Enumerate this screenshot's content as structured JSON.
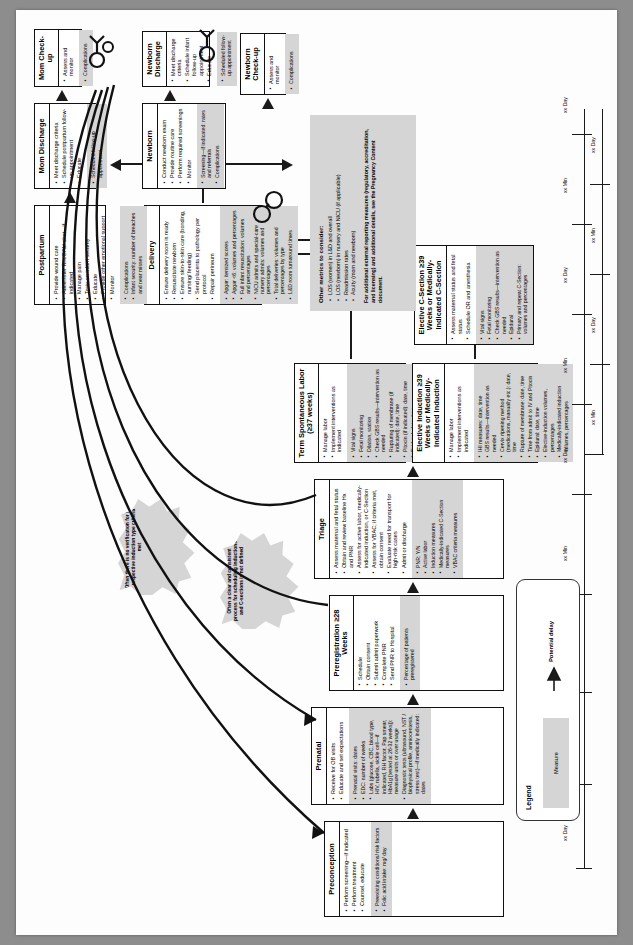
{
  "document": {
    "orientation": "landscape-rotated",
    "title": "Pregnancy Care Process Flow"
  },
  "legend": {
    "title": "Legend",
    "measure_label": "Measure",
    "delay_label": "Potential delay"
  },
  "notes": {
    "title": "Other metrics to consider:",
    "items": [
      "LOS (women) in L&D and overall",
      "LOS (newborn) in nursery and NICU (if applicable)",
      "Readmission rates",
      "Acuity (mom and newborn)"
    ],
    "footer": "For additional external reporting measures (regulatory, accreditation, and licensing) and additional details, see the Pregnancy Content document."
  },
  "bursts": [
    {
      "id": "burst-scheduling",
      "text": "Often a clear and consistent process for scheduling inductions and C-sections is not defined"
    },
    {
      "id": "burst-verification",
      "text": "Often there is no verification for the respective induction type criteria met"
    }
  ],
  "timeline": {
    "day_label": "xx Day",
    "min_label": "xx Min",
    "marks": [
      "xx Day",
      "xx Min",
      "xx Day",
      "xx Min",
      "xx Day",
      "xx Min",
      "xx Day",
      "xx Min",
      "xx Day",
      "xx Min",
      "xx Day",
      "xx Min",
      "xx Day",
      "xx Min",
      "xx Min",
      "xx Min",
      "xx Min"
    ]
  },
  "boxes": [
    {
      "id": "preconception",
      "title": "Preconception",
      "steps": [
        "Perform screening—if indicated",
        "Perform treatment",
        "Counsel, educate"
      ],
      "measures": [
        "Preexisting conditions/ risk factors",
        "Folic acid intake: mg/ day"
      ]
    },
    {
      "id": "prenatal",
      "title": "Prenatal",
      "steps": [
        "Receive for OB visits",
        "Educate and set expectations"
      ],
      "measures": [
        "Prenatal visits: dates",
        "EDC: number of weeks",
        "Labs (glucose, CBC, blood type, HIV, rubella, sickle cell—if indicated, RH factor, Pap smear, HbA1g [tested at 26-32 weeks]): measure units or over usage",
        "Diagnostic tests (ultrasound, NST / biophysical profile, amniocentesis, stress test)—if medically indicated: dates"
      ]
    },
    {
      "id": "preregistration",
      "title": "Preregistration ≥28 Weeks",
      "steps": [
        "Schedule",
        "Obtain consent",
        "Submit admit paperwork",
        "Complete PNR",
        "Send PNR to Hospital"
      ],
      "measures": [
        "Percentage of patients preregistered"
      ]
    },
    {
      "id": "triage",
      "title": "Triage",
      "steps": [
        "Assess maternal and fetal status",
        "Obtain and review baseline Hx and PNR",
        "Assess for active labor, medically-indicated induction, or C-Section",
        "Assess for VBAC; if criteria met, obtain consent",
        "Evaluate need for transport for high-risk cases",
        "Admit or discharge"
      ],
      "measures": [
        "PNR: Y/N",
        "Active labor",
        "Induction measures",
        "Medically-indicated C-Section measures",
        "VBAC criteria measures"
      ]
    },
    {
      "id": "term-spontaneous-labor",
      "title": "Term Spontaneous Labor (≥37 weeks)",
      "steps": [
        "Manage labor",
        "Implement interventions as indicated"
      ],
      "measures": [
        "Vital signs",
        "Fetal monitoring",
        "Dilation, station",
        "Check GBS results—intervention as needed",
        "Rupturing of membrane (if indicated): date, time",
        "Pitocin (if indicated): date, time",
        "Epidural: date, time"
      ]
    },
    {
      "id": "elective-induction",
      "title": "Elective Induction ≥39 Weeks or Medically-Indicated Induction",
      "steps": [
        "Manage labor",
        "Implement interventions as indicated"
      ],
      "measures": [
        "IHI measures: date, time",
        "GBS results—intervention as needed",
        "Cervix ripening method (medications, manually etc.): date, time",
        "Rupture of membrane: date, time",
        "Time from admit to IV and Pitocin",
        "Epidural: date, time",
        "Elective-induction volumes, percentages",
        "Medically-indicated induction volumes, percentages"
      ]
    },
    {
      "id": "elective-c-section",
      "title": "Elective C-Section ≥39 Weeks or Medically-Indicated C-Section",
      "steps": [
        "Assess maternal status and fetal status",
        "Schedule OR and anesthesia"
      ],
      "measures": [
        "Vital signs",
        "Fetal monitoring",
        "Check GBS results—intervention as needed",
        "Epidural",
        "Primary and repeat C-Section: volumes and percentages"
      ]
    },
    {
      "id": "delivery",
      "title": "Delivery",
      "steps": [
        "Ensure delivery room is ready",
        "Resuscitate newborn",
        "Ensure skin-to-skin care (bonding, nursing/ feeding)",
        "Send placenta to pathology per protocol",
        "Repair perineum"
      ],
      "measures": [
        "Apgar: itemized scores",
        "Apgar <6: volumes and percentages",
        "Full infant resuscitation: volumes and percentages",
        "NICU admits and special-care nursery admits: volumes and percentages",
        "Total deliveries: volumes and percentages by type",
        "L&D room turnaround times"
      ]
    },
    {
      "id": "postpartum",
      "title": "Postpartum",
      "steps": [
        "Provide wound care",
        "Administer RhoGAM shot—if indicated",
        "Manage pain",
        "Train on infant security",
        "Educate",
        "Provide other emotional support",
        "Monitor"
      ],
      "measures": [
        "Complications",
        "Infant security: number of breaches and near misses"
      ]
    },
    {
      "id": "mom-discharge",
      "title": "Mom Discharge",
      "steps": [
        "Meet discharge criteria",
        "Schedule postpartum follow-up appointment",
        "Educate"
      ],
      "measures": [
        "Scheduled follow-up appointment"
      ]
    },
    {
      "id": "mom-check-up",
      "title": "Mom Check-up",
      "steps": [
        "Assess and monitor"
      ],
      "measures": [
        "Complications"
      ]
    },
    {
      "id": "newborn",
      "title": "Newborn",
      "steps": [
        "Conduct newborn exam",
        "Provide routine care",
        "Perform required screenings",
        "Monitor"
      ],
      "measures": [
        "Screening—if indicated: rates and referrals",
        "Complications"
      ]
    },
    {
      "id": "newborn-discharge",
      "title": "Newborn Discharge",
      "steps": [
        "Meet discharge criteria",
        "Schedule infant follow-up appointment",
        "Educate"
      ],
      "measures": [
        "Scheduled follow-up appointment"
      ]
    },
    {
      "id": "newborn-check-up",
      "title": "Newborn Check-up",
      "steps": [
        "Assess and monitor"
      ],
      "measures": [
        "Complications"
      ]
    }
  ]
}
